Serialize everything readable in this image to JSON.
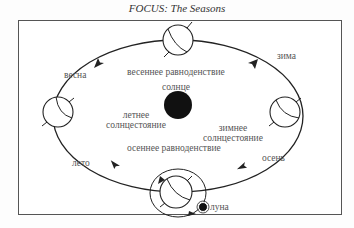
{
  "title": "FOCUS: The Seasons",
  "labels": {
    "spring": "весна",
    "winter": "зима",
    "summer": "лето",
    "autumn": "осень",
    "vernal_equinox": "весеннее равноденствие",
    "summer_solstice_1": "летнее",
    "summer_solstice_2": "солнцестояние",
    "sun": "солнце",
    "winter_solstice_1": "зимнее",
    "winter_solstice_2": "солнцестояние",
    "autumnal_equinox": "осеннее равноденствие",
    "moon": "луна"
  },
  "colors": {
    "line": "#222222",
    "sun": "#111111",
    "frame": "#555555",
    "text": "#555555"
  }
}
